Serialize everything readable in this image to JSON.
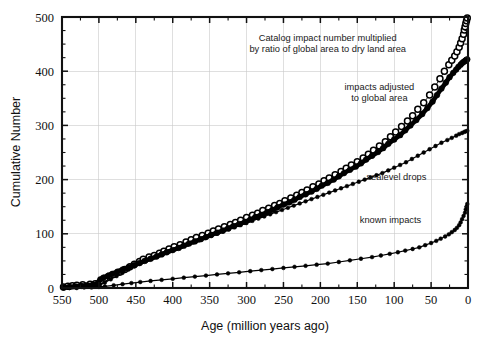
{
  "chart_data": {
    "type": "scatter",
    "title": "",
    "xlabel": "Age (million years ago)",
    "ylabel": "Cumulative Number",
    "xlim": [
      550,
      0
    ],
    "ylim": [
      0,
      500
    ],
    "x_ticks": [
      550,
      500,
      450,
      400,
      350,
      300,
      250,
      200,
      150,
      100,
      50,
      0
    ],
    "y_ticks": [
      0,
      100,
      200,
      300,
      400,
      500
    ],
    "x_reversed": true,
    "grid": true,
    "legend_position": "inline-annotations",
    "annotations": [
      {
        "id": "annotation-catalog-impact",
        "text_line_1": "Catalog impact number multiplied",
        "text_line_2": "by ratio of global area to dry land area",
        "x_data": 190,
        "y_data": 455
      },
      {
        "id": "annotation-impacts-adjusted",
        "text_line_1": "impacts adjusted",
        "text_line_2": "to global area",
        "x_data": 120,
        "y_data": 365
      },
      {
        "id": "annotation-sealevel-drops",
        "text_line_1": "sealevel drops",
        "text_line_2": "",
        "x_data": 97,
        "y_data": 200
      },
      {
        "id": "annotation-known-impacts",
        "text_line_1": "known impacts",
        "text_line_2": "",
        "x_data": 105,
        "y_data": 120
      }
    ],
    "series": [
      {
        "name": "Catalog impact number multiplied by ratio of global area to dry land area",
        "marker": "open-circle",
        "x": [
          548,
          542,
          536,
          530,
          522,
          512,
          505,
          500,
          497,
          492,
          486,
          480,
          472,
          465,
          458,
          452,
          445,
          440,
          432,
          425,
          418,
          412,
          405,
          398,
          390,
          382,
          375,
          368,
          360,
          352,
          345,
          338,
          330,
          322,
          315,
          308,
          300,
          292,
          285,
          278,
          270,
          262,
          255,
          248,
          240,
          232,
          225,
          218,
          210,
          202,
          195,
          188,
          180,
          172,
          165,
          158,
          150,
          142,
          135,
          128,
          120,
          112,
          105,
          98,
          90,
          82,
          75,
          68,
          60,
          52,
          45,
          38,
          32,
          26,
          22,
          18,
          15,
          12,
          10,
          8,
          6,
          5,
          4,
          3,
          2,
          1
        ],
        "y": [
          2,
          3,
          4,
          5,
          6,
          7,
          8,
          9,
          14,
          18,
          22,
          25,
          29,
          34,
          39,
          44,
          49,
          53,
          57,
          60,
          64,
          68,
          72,
          76,
          80,
          85,
          89,
          93,
          97,
          101,
          105,
          109,
          113,
          117,
          121,
          125,
          130,
          134,
          138,
          143,
          147,
          152,
          156,
          161,
          166,
          171,
          176,
          181,
          187,
          192,
          198,
          203,
          209,
          215,
          221,
          227,
          233,
          240,
          247,
          254,
          262,
          270,
          279,
          288,
          298,
          308,
          318,
          330,
          342,
          356,
          371,
          386,
          400,
          412,
          420,
          428,
          436,
          444,
          452,
          460,
          468,
          476,
          482,
          488,
          493,
          498
        ]
      },
      {
        "name": "impacts adjusted to global area",
        "marker": "filled-circle-dense",
        "x": [
          548,
          540,
          532,
          524,
          516,
          508,
          502,
          498,
          494,
          488,
          482,
          475,
          468,
          460,
          452,
          445,
          438,
          430,
          422,
          415,
          408,
          400,
          392,
          385,
          378,
          370,
          362,
          355,
          348,
          340,
          332,
          325,
          318,
          310,
          302,
          295,
          288,
          280,
          272,
          265,
          258,
          250,
          242,
          235,
          228,
          220,
          212,
          205,
          198,
          190,
          182,
          175,
          168,
          160,
          152,
          145,
          138,
          130,
          122,
          115,
          108,
          100,
          92,
          85,
          78,
          70,
          62,
          55,
          48,
          42,
          36,
          30,
          25,
          20,
          16,
          13,
          10,
          8,
          6,
          4,
          3,
          2,
          1
        ],
        "y": [
          1,
          2,
          3,
          4,
          5,
          6,
          7,
          16,
          19,
          22,
          26,
          30,
          34,
          38,
          42,
          46,
          50,
          54,
          58,
          62,
          66,
          70,
          74,
          78,
          82,
          86,
          90,
          94,
          98,
          102,
          106,
          110,
          114,
          118,
          122,
          126,
          131,
          135,
          140,
          144,
          149,
          154,
          158,
          163,
          168,
          173,
          178,
          183,
          189,
          194,
          200,
          206,
          212,
          218,
          224,
          230,
          237,
          244,
          251,
          258,
          266,
          274,
          282,
          291,
          300,
          310,
          321,
          332,
          344,
          356,
          368,
          379,
          389,
          397,
          403,
          408,
          412,
          415,
          417,
          419,
          420,
          421,
          422
        ]
      },
      {
        "name": "sealevel drops",
        "marker": "filled-circle-small",
        "x": [
          548,
          540,
          530,
          520,
          510,
          500,
          492,
          484,
          476,
          468,
          460,
          452,
          444,
          436,
          428,
          420,
          412,
          404,
          396,
          388,
          380,
          372,
          364,
          356,
          348,
          340,
          332,
          324,
          316,
          308,
          300,
          292,
          284,
          276,
          268,
          260,
          252,
          244,
          236,
          228,
          220,
          212,
          204,
          196,
          188,
          180,
          172,
          164,
          156,
          148,
          140,
          132,
          124,
          116,
          108,
          100,
          92,
          84,
          76,
          68,
          60,
          52,
          44,
          36,
          28,
          22,
          16,
          12,
          8,
          5,
          3,
          1
        ],
        "y": [
          1,
          2,
          3,
          4,
          5,
          6,
          10,
          16,
          22,
          28,
          34,
          40,
          45,
          50,
          55,
          60,
          64,
          68,
          72,
          76,
          80,
          84,
          88,
          92,
          96,
          100,
          104,
          108,
          112,
          116,
          120,
          124,
          128,
          132,
          136,
          140,
          144,
          148,
          152,
          156,
          160,
          164,
          168,
          172,
          176,
          180,
          184,
          188,
          192,
          196,
          200,
          204,
          208,
          212,
          217,
          222,
          227,
          232,
          238,
          244,
          250,
          256,
          262,
          268,
          273,
          277,
          281,
          284,
          286,
          288,
          289,
          290
        ]
      },
      {
        "name": "known impacts",
        "marker": "filled-circle-small",
        "x": [
          548,
          540,
          530,
          520,
          510,
          500,
          492,
          480,
          468,
          456,
          444,
          430,
          415,
          400,
          385,
          370,
          355,
          340,
          325,
          310,
          295,
          280,
          265,
          250,
          235,
          220,
          205,
          190,
          175,
          160,
          145,
          130,
          118,
          106,
          95,
          85,
          75,
          66,
          58,
          50,
          43,
          37,
          31,
          26,
          22,
          18,
          15,
          12,
          10,
          8,
          6,
          4,
          3,
          2,
          1
        ],
        "y": [
          0,
          0,
          0,
          1,
          1,
          2,
          3,
          5,
          7,
          9,
          11,
          13,
          15,
          17,
          19,
          21,
          23,
          25,
          27,
          29,
          31,
          33,
          35,
          37,
          39,
          41,
          43,
          45,
          48,
          51,
          54,
          57,
          60,
          63,
          66,
          69,
          72,
          75,
          79,
          83,
          87,
          91,
          95,
          99,
          103,
          107,
          111,
          116,
          121,
          127,
          133,
          139,
          145,
          150,
          155
        ]
      }
    ]
  },
  "figure": {
    "axis": {
      "x_title": "Age (million years ago)",
      "y_title": "Cumulative Number"
    }
  }
}
